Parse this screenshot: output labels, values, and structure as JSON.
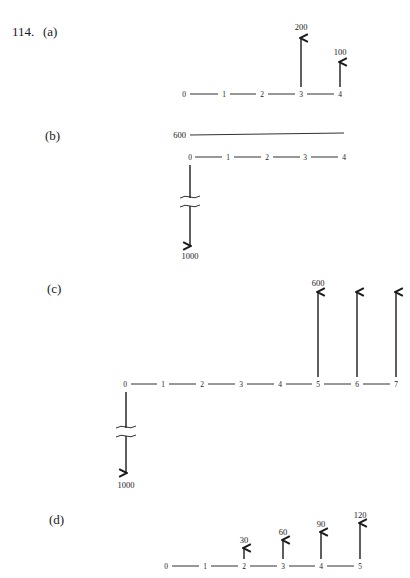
{
  "problem_number": "114.",
  "parts": [
    {
      "id": "a",
      "label": "(a)",
      "periods": [
        "0",
        "1",
        "2",
        "3",
        "4"
      ],
      "cash_flows": [
        {
          "period": "3",
          "direction": "up",
          "amount": "200"
        },
        {
          "period": "4",
          "direction": "up",
          "amount": "100"
        }
      ]
    },
    {
      "id": "b",
      "label": "(b)",
      "periods": [
        "0",
        "1",
        "2",
        "3",
        "4"
      ],
      "level_line": {
        "amount": "600",
        "from_period": "0",
        "to_period": "4"
      },
      "cash_flows": [
        {
          "period": "0",
          "direction": "down",
          "amount": "1000",
          "broken": true
        }
      ]
    },
    {
      "id": "c",
      "label": "(c)",
      "periods": [
        "0",
        "1",
        "2",
        "3",
        "4",
        "5",
        "6",
        "7"
      ],
      "cash_flows": [
        {
          "period": "0",
          "direction": "down",
          "amount": "1000",
          "broken": true
        },
        {
          "period": "5",
          "direction": "up",
          "amount": "600"
        },
        {
          "period": "6",
          "direction": "up",
          "amount": ""
        },
        {
          "period": "7",
          "direction": "up",
          "amount": ""
        }
      ]
    },
    {
      "id": "d",
      "label": "(d)",
      "periods": [
        "0",
        "1",
        "2",
        "3",
        "4",
        "5"
      ],
      "cash_flows": [
        {
          "period": "2",
          "direction": "up",
          "amount": "30"
        },
        {
          "period": "3",
          "direction": "up",
          "amount": "60"
        },
        {
          "period": "4",
          "direction": "up",
          "amount": "90"
        },
        {
          "period": "5",
          "direction": "up",
          "amount": "120"
        }
      ]
    }
  ]
}
